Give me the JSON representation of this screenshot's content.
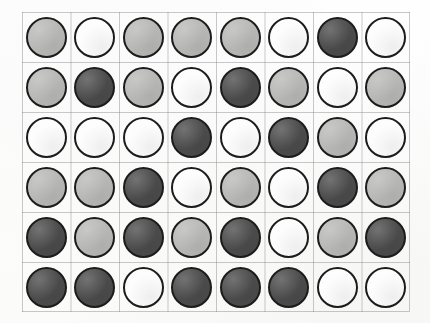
{
  "board": {
    "title": "token-grid",
    "columns": 8,
    "rows": 6,
    "background_color": "#fdfdfc",
    "gridline_color": "#787880",
    "token_outline_color": "#1c1c1c",
    "fill_colors": {
      "white": "#fdfdfd",
      "gray": "#b9b9b7",
      "dark": "#4c4c4c"
    },
    "legend": [
      {
        "key": "white",
        "label": "white"
      },
      {
        "key": "gray",
        "label": "light gray"
      },
      {
        "key": "dark",
        "label": "dark gray"
      }
    ],
    "grid": [
      [
        "gray",
        "white",
        "gray",
        "gray",
        "gray",
        "white",
        "dark",
        "white"
      ],
      [
        "gray",
        "dark",
        "gray",
        "white",
        "dark",
        "gray",
        "white",
        "gray"
      ],
      [
        "white",
        "white",
        "white",
        "dark",
        "white",
        "dark",
        "gray",
        "white"
      ],
      [
        "gray",
        "gray",
        "dark",
        "white",
        "gray",
        "white",
        "dark",
        "gray"
      ],
      [
        "dark",
        "gray",
        "dark",
        "gray",
        "dark",
        "white",
        "gray",
        "dark"
      ],
      [
        "dark",
        "dark",
        "white",
        "dark",
        "dark",
        "dark",
        "white",
        "white"
      ]
    ]
  }
}
